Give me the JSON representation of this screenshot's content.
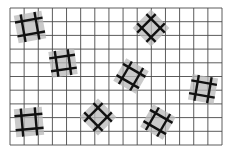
{
  "canvas": {
    "width": 234,
    "height": 153,
    "background": "#ffffff"
  },
  "grid": {
    "x0": 10,
    "y0": 8,
    "x1": 222,
    "y1": 145,
    "cols": 15,
    "rows": 10,
    "line_color": "#4a4a4a",
    "line_width": 0.9
  },
  "tile_style": {
    "fill": "#b8b8b8",
    "fill_opacity": 0.75,
    "cross_color": "#111111",
    "cross_width": 2.4
  },
  "tiles": [
    {
      "id": "tile-1",
      "cx": 30,
      "cy": 27,
      "size": 28,
      "rotation": -10
    },
    {
      "id": "tile-2",
      "cx": 63,
      "cy": 63,
      "size": 26,
      "rotation": -8
    },
    {
      "id": "tile-3",
      "cx": 151,
      "cy": 28,
      "size": 26,
      "rotation": 45
    },
    {
      "id": "tile-4",
      "cx": 131,
      "cy": 76,
      "size": 26,
      "rotation": 30
    },
    {
      "id": "tile-5",
      "cx": 98,
      "cy": 117,
      "size": 26,
      "rotation": 45
    },
    {
      "id": "tile-6",
      "cx": 29,
      "cy": 122,
      "size": 28,
      "rotation": -5
    },
    {
      "id": "tile-7",
      "cx": 203,
      "cy": 89,
      "size": 26,
      "rotation": 10
    },
    {
      "id": "tile-8",
      "cx": 158,
      "cy": 122,
      "size": 26,
      "rotation": 30
    }
  ]
}
